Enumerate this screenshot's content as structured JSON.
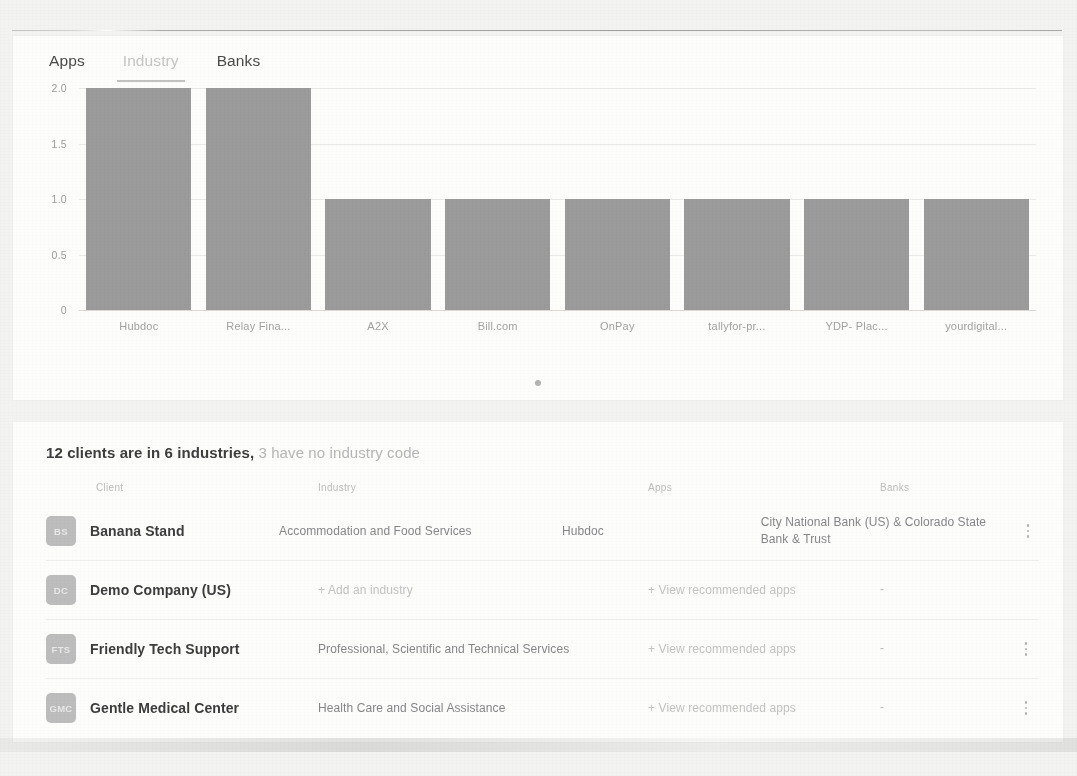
{
  "page": {
    "top_clipped_text": "",
    "background_color": "#f3f3f1"
  },
  "chart_card": {
    "tabs": [
      {
        "label": "Apps",
        "active": false,
        "underlined": false,
        "muted": false
      },
      {
        "label": "Industry",
        "active": true,
        "underlined": true,
        "muted": true
      },
      {
        "label": "Banks",
        "active": false,
        "underlined": false,
        "muted": false
      }
    ],
    "carousel": {
      "dots": 1,
      "active_index": 0
    }
  },
  "chart_data": {
    "type": "bar",
    "title": "",
    "xlabel": "",
    "ylabel": "",
    "categories": [
      "Hubdoc",
      "Relay Fina...",
      "A2X",
      "Bill.com",
      "OnPay",
      "tallyfor-pr...",
      "YDP- Plac...",
      "yourdigital..."
    ],
    "values": [
      2,
      2,
      1,
      1,
      1,
      1,
      1,
      1
    ],
    "ylim": [
      0,
      2
    ],
    "yticks": [
      "2.0",
      "1.5",
      "1.0",
      "0.5",
      "0"
    ],
    "ytick_values": [
      2.0,
      1.5,
      1.0,
      0.5,
      0
    ],
    "grid": true,
    "legend": false,
    "bar_color": "#9b9b9b"
  },
  "table_card": {
    "summary": {
      "strong": "12 clients are in 6 industries,",
      "dim": " 3 have no industry code"
    },
    "headers": {
      "client": "Client",
      "industry": "Industry",
      "apps": "Apps",
      "banks": "Banks"
    },
    "rows": [
      {
        "initials": "BS",
        "client": "Banana Stand",
        "industry": "Accommodation and Food Services",
        "industry_is_link": false,
        "apps": "Hubdoc",
        "apps_is_link": false,
        "banks": "City National Bank (US) & Colorado State Bank & Trust",
        "has_menu": true
      },
      {
        "initials": "DC",
        "client": "Demo Company (US)",
        "industry": "+ Add an industry",
        "industry_is_link": true,
        "apps": "+ View recommended apps",
        "apps_is_link": true,
        "banks": "-",
        "has_menu": false
      },
      {
        "initials": "FTS",
        "client": "Friendly Tech Support",
        "industry": "Professional, Scientific and Technical Services",
        "industry_is_link": false,
        "apps": "+ View recommended apps",
        "apps_is_link": true,
        "banks": "-",
        "has_menu": true
      },
      {
        "initials": "GMC",
        "client": "Gentle Medical Center",
        "industry": "Health Care and Social Assistance",
        "industry_is_link": false,
        "apps": "+ View recommended apps",
        "apps_is_link": true,
        "banks": "-",
        "has_menu": true
      }
    ],
    "menu_icon": "kebab-menu-icon"
  }
}
